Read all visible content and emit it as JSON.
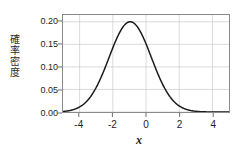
{
  "chart_data": {
    "type": "line",
    "title": "",
    "subtitle": "",
    "xlabel": "x",
    "ylabel": "確率密度",
    "ylabel_chars": [
      "確",
      "率",
      "密",
      "度"
    ],
    "xlim": [
      -5,
      5
    ],
    "ylim": [
      0.0,
      0.215
    ],
    "xticks": [
      -4,
      -2,
      0,
      2,
      4
    ],
    "xtick_labels": [
      "-4",
      "-2",
      "0",
      "2",
      "4"
    ],
    "yticks": [
      0.0,
      0.05,
      0.1,
      0.15,
      0.2
    ],
    "ytick_labels": [
      "0.00",
      "0.05",
      "0.10",
      "0.15",
      "0.20"
    ],
    "grid": true,
    "grid_color": "#c9c9c9",
    "legend": false,
    "legend_position": "none",
    "curve_color": "#1a1a1a",
    "frame_color": "#8a8a8a",
    "background_color": "#ffffff",
    "distribution": {
      "kind": "normal-density",
      "mean": -0.95,
      "sigma": 1.27,
      "peak_value": 0.2,
      "peak_x": -0.95
    },
    "series": [
      {
        "name": "probability density",
        "x": [
          -5.0,
          -4.75,
          -4.5,
          -4.25,
          -4.0,
          -3.75,
          -3.5,
          -3.25,
          -3.0,
          -2.75,
          -2.5,
          -2.25,
          -2.0,
          -1.75,
          -1.5,
          -1.25,
          -1.0,
          -0.95,
          -0.75,
          -0.5,
          -0.25,
          0.0,
          0.25,
          0.5,
          0.75,
          1.0,
          1.25,
          1.5,
          1.75,
          2.0,
          2.25,
          2.5,
          2.75,
          3.0,
          3.25,
          3.5,
          3.75,
          4.0,
          4.25,
          4.5,
          4.75,
          5.0
        ],
        "y": [
          0.0016,
          0.0026,
          0.0042,
          0.0066,
          0.0101,
          0.0151,
          0.022,
          0.0312,
          0.0429,
          0.0574,
          0.0746,
          0.0942,
          0.1156,
          0.1377,
          0.1591,
          0.1781,
          0.1931,
          0.1995,
          0.1954,
          0.1843,
          0.1681,
          0.1487,
          0.1277,
          0.1066,
          0.0864,
          0.068,
          0.052,
          0.0386,
          0.0278,
          0.0195,
          0.0132,
          0.0087,
          0.0056,
          0.0035,
          0.0021,
          0.0012,
          0.0007,
          0.0004,
          0.0002,
          0.0001,
          0.0001,
          0.0
        ]
      }
    ]
  },
  "axes": {
    "x_tick_positions_px": [
      76,
      102,
      128,
      180,
      206
    ],
    "y_axis_caption": "確率密度"
  }
}
